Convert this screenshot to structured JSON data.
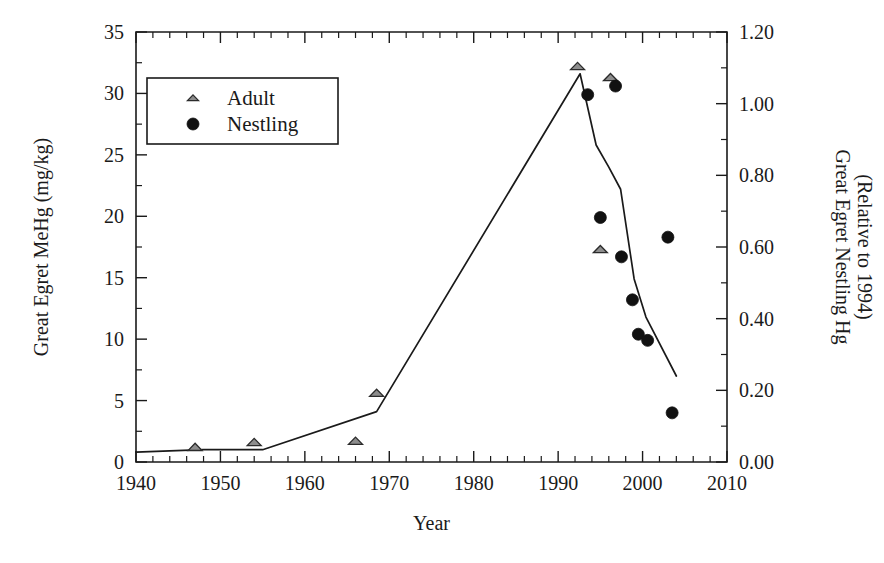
{
  "chart_data": {
    "type": "scatter",
    "title": "",
    "xlabel": "Year",
    "ylabel": "Great Egret MeHg (mg/kg)",
    "y2label": "Great Egret Nestling Hg (Relative to 1994)",
    "y2label_line1": "Great Egret Nestling Hg",
    "y2label_line2": "(Relative to 1994)",
    "xlim": [
      1940,
      2010
    ],
    "ylim": [
      0,
      35
    ],
    "y2lim": [
      0.0,
      1.2
    ],
    "grid": false,
    "legend_position": "top-left",
    "x_ticks": [
      1940,
      1950,
      1960,
      1970,
      1980,
      1990,
      2000,
      2010
    ],
    "x_tick_labels": [
      "1940",
      "1950",
      "1960",
      "1970",
      "1980",
      "1990",
      "2000",
      "2010"
    ],
    "x_minor_interval": 2,
    "y_ticks": [
      0,
      5,
      10,
      15,
      20,
      25,
      30,
      35
    ],
    "y_tick_labels": [
      "0",
      "5",
      "10",
      "15",
      "20",
      "25",
      "30",
      "35"
    ],
    "y_minor_interval": 2.5,
    "y2_ticks": [
      0.0,
      0.2,
      0.4,
      0.6,
      0.8,
      1.0,
      1.2
    ],
    "y2_tick_labels": [
      "0.00",
      "0.20",
      "0.40",
      "0.60",
      "0.80",
      "1.00",
      "1.20"
    ],
    "y2_minor_interval": 0.1,
    "series": [
      {
        "name": "Adult",
        "marker": "triangle",
        "axis": "left",
        "points": [
          {
            "x": 1947.0,
            "y": 1.2
          },
          {
            "x": 1954.0,
            "y": 1.6
          },
          {
            "x": 1966.0,
            "y": 1.7
          },
          {
            "x": 1968.5,
            "y": 5.6
          },
          {
            "x": 1992.3,
            "y": 32.2
          },
          {
            "x": 1996.2,
            "y": 31.3
          },
          {
            "x": 1995.0,
            "y": 17.3
          }
        ]
      },
      {
        "name": "Nestling",
        "marker": "circle",
        "axis": "left",
        "points": [
          {
            "x": 1993.5,
            "y": 29.9
          },
          {
            "x": 1996.8,
            "y": 30.6
          },
          {
            "x": 1995.0,
            "y": 19.9
          },
          {
            "x": 1997.5,
            "y": 16.7
          },
          {
            "x": 2003.0,
            "y": 18.3
          },
          {
            "x": 1998.8,
            "y": 13.2
          },
          {
            "x": 1999.5,
            "y": 10.4
          },
          {
            "x": 2000.6,
            "y": 9.9
          },
          {
            "x": 2003.5,
            "y": 4.0
          }
        ]
      },
      {
        "name": "Trend line",
        "marker": "none",
        "axis": "left",
        "points": [
          {
            "x": 1940.0,
            "y": 0.8
          },
          {
            "x": 1948.0,
            "y": 1.0
          },
          {
            "x": 1955.0,
            "y": 1.0
          },
          {
            "x": 1968.5,
            "y": 4.1
          },
          {
            "x": 1992.6,
            "y": 31.6
          },
          {
            "x": 1994.5,
            "y": 25.8
          },
          {
            "x": 1996.0,
            "y": 24.0
          },
          {
            "x": 1997.4,
            "y": 22.2
          },
          {
            "x": 1999.0,
            "y": 14.9
          },
          {
            "x": 2000.4,
            "y": 11.8
          },
          {
            "x": 2004.0,
            "y": 7.0
          }
        ]
      }
    ],
    "legend": [
      {
        "label": "Adult",
        "marker": "triangle"
      },
      {
        "label": "Nestling",
        "marker": "circle"
      }
    ]
  }
}
